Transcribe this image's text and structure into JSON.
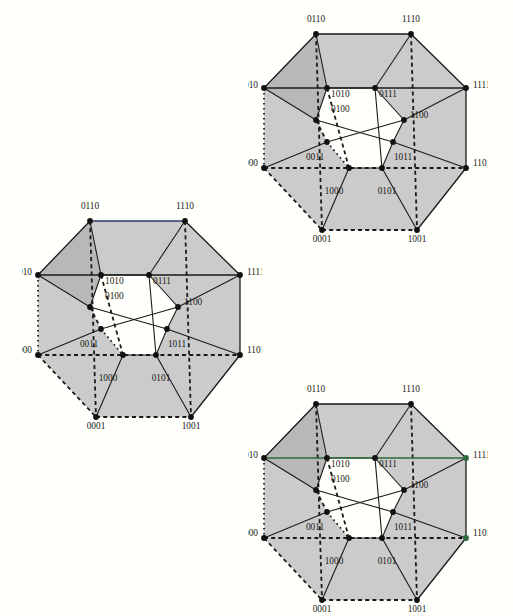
{
  "document": {
    "title": "Four-dimensional hypercube (tesseract) vertex-labelled diagrams",
    "figure_count": 3,
    "background_color": "#fffffb",
    "face_shade_color": "#c8c8c8",
    "face_shade_dark_color": "#b4b4b4",
    "edge_color": "#1a1a1a",
    "accent_green": "#2f6b3a",
    "accent_navy": "#2b3a6b",
    "vertex_color": "#111111"
  },
  "vertex_labels": {
    "v0000": "0000",
    "v0001": "0001",
    "v0010": "0010",
    "v0011": "0011",
    "v0100": "0100",
    "v0101": "0101",
    "v0110": "0110",
    "v0111": "0111",
    "v1000": "1000",
    "v1001": "1001",
    "v1010": "1010",
    "v1011": "1011",
    "v1100": "1100",
    "v1101": "1101",
    "v1110": "1110",
    "v1111": "1111"
  },
  "figures": [
    {
      "id": "figure-top-right",
      "name": "tesseract-top-right",
      "position": {
        "left": 248,
        "top": 8
      },
      "highlight_edges": [],
      "labels": [
        {
          "key": "v0110",
          "text": "0110",
          "x": 68,
          "y": 14,
          "anchor": "middle"
        },
        {
          "key": "v1110",
          "text": "1110",
          "x": 163,
          "y": 14,
          "anchor": "middle"
        },
        {
          "key": "v0010",
          "text": "0010",
          "x": 10,
          "y": 80,
          "anchor": "end"
        },
        {
          "key": "v1111",
          "text": "1111",
          "x": 225,
          "y": 80,
          "anchor": "start"
        },
        {
          "key": "v1010",
          "text": "1010",
          "x": 83,
          "y": 89,
          "anchor": "start"
        },
        {
          "key": "v0111",
          "text": "0111",
          "x": 131,
          "y": 89,
          "anchor": "start"
        },
        {
          "key": "v0100",
          "text": "0100",
          "x": 83,
          "y": 104,
          "anchor": "start"
        },
        {
          "key": "v1100",
          "text": "1100",
          "x": 162,
          "y": 110,
          "anchor": "start"
        },
        {
          "key": "v0011",
          "text": "0011",
          "x": 67,
          "y": 152,
          "anchor": "middle"
        },
        {
          "key": "v1011",
          "text": "1011",
          "x": 155,
          "y": 152,
          "anchor": "middle"
        },
        {
          "key": "v0000",
          "text": "0000",
          "x": 10,
          "y": 158,
          "anchor": "end"
        },
        {
          "key": "v1101",
          "text": "1101",
          "x": 225,
          "y": 158,
          "anchor": "start"
        },
        {
          "key": "v1000",
          "text": "1000",
          "x": 86,
          "y": 186,
          "anchor": "middle"
        },
        {
          "key": "v0101",
          "text": "0101",
          "x": 139,
          "y": 186,
          "anchor": "middle"
        },
        {
          "key": "v0001",
          "text": "0001",
          "x": 74,
          "y": 234,
          "anchor": "middle"
        },
        {
          "key": "v1001",
          "text": "1001",
          "x": 169,
          "y": 234,
          "anchor": "middle"
        }
      ]
    },
    {
      "id": "figure-middle-left",
      "name": "tesseract-middle-left",
      "position": {
        "left": 22,
        "top": 195
      },
      "highlight_edges": [
        "0110-1110",
        "0001-1001",
        "0100-1100",
        "0011-1011",
        "0010-0000"
      ],
      "labels": [
        {
          "key": "v0110",
          "text": "0110",
          "x": 68,
          "y": 14,
          "anchor": "middle"
        },
        {
          "key": "v1110",
          "text": "1110",
          "x": 163,
          "y": 14,
          "anchor": "middle"
        },
        {
          "key": "v0010",
          "text": "0010",
          "x": 10,
          "y": 80,
          "anchor": "end"
        },
        {
          "key": "v1111",
          "text": "1111",
          "x": 225,
          "y": 80,
          "anchor": "start"
        },
        {
          "key": "v1010",
          "text": "1010",
          "x": 83,
          "y": 89,
          "anchor": "start"
        },
        {
          "key": "v0111",
          "text": "0111",
          "x": 131,
          "y": 89,
          "anchor": "start"
        },
        {
          "key": "v0100",
          "text": "0100",
          "x": 83,
          "y": 104,
          "anchor": "start"
        },
        {
          "key": "v1100",
          "text": "1100",
          "x": 162,
          "y": 110,
          "anchor": "start"
        },
        {
          "key": "v0011",
          "text": "0011",
          "x": 67,
          "y": 152,
          "anchor": "middle"
        },
        {
          "key": "v1011",
          "text": "1011",
          "x": 155,
          "y": 152,
          "anchor": "middle"
        },
        {
          "key": "v0000",
          "text": "0000",
          "x": 10,
          "y": 158,
          "anchor": "end"
        },
        {
          "key": "v1101",
          "text": "1101",
          "x": 225,
          "y": 158,
          "anchor": "start"
        },
        {
          "key": "v1000",
          "text": "1000",
          "x": 86,
          "y": 186,
          "anchor": "middle"
        },
        {
          "key": "v0101",
          "text": "0101",
          "x": 139,
          "y": 186,
          "anchor": "middle"
        },
        {
          "key": "v0001",
          "text": "0001",
          "x": 74,
          "y": 234,
          "anchor": "middle"
        },
        {
          "key": "v1001",
          "text": "1001",
          "x": 169,
          "y": 234,
          "anchor": "middle"
        }
      ]
    },
    {
      "id": "figure-bottom-right",
      "name": "tesseract-bottom-right",
      "position": {
        "left": 248,
        "top": 378
      },
      "highlight_edges": [
        "0010-1111",
        "0000-1101"
      ],
      "labels": [
        {
          "key": "v0110",
          "text": "0110",
          "x": 68,
          "y": 14,
          "anchor": "middle"
        },
        {
          "key": "v1110",
          "text": "1110",
          "x": 163,
          "y": 14,
          "anchor": "middle"
        },
        {
          "key": "v0010",
          "text": "0010",
          "x": 10,
          "y": 80,
          "anchor": "end"
        },
        {
          "key": "v1111",
          "text": "1111",
          "x": 225,
          "y": 80,
          "anchor": "start"
        },
        {
          "key": "v1010",
          "text": "1010",
          "x": 83,
          "y": 89,
          "anchor": "start"
        },
        {
          "key": "v0111",
          "text": "0111",
          "x": 131,
          "y": 89,
          "anchor": "start"
        },
        {
          "key": "v0100",
          "text": "0100",
          "x": 83,
          "y": 104,
          "anchor": "start"
        },
        {
          "key": "v1100",
          "text": "1100",
          "x": 162,
          "y": 110,
          "anchor": "start"
        },
        {
          "key": "v0011",
          "text": "0011",
          "x": 67,
          "y": 152,
          "anchor": "middle"
        },
        {
          "key": "v1011",
          "text": "1011",
          "x": 155,
          "y": 152,
          "anchor": "middle"
        },
        {
          "key": "v0000",
          "text": "0000",
          "x": 10,
          "y": 158,
          "anchor": "end"
        },
        {
          "key": "v1101",
          "text": "1101",
          "x": 225,
          "y": 158,
          "anchor": "start"
        },
        {
          "key": "v1000",
          "text": "1000",
          "x": 86,
          "y": 186,
          "anchor": "middle"
        },
        {
          "key": "v0101",
          "text": "0101",
          "x": 139,
          "y": 186,
          "anchor": "middle"
        },
        {
          "key": "v0001",
          "text": "0001",
          "x": 74,
          "y": 234,
          "anchor": "middle"
        },
        {
          "key": "v1001",
          "text": "1001",
          "x": 169,
          "y": 234,
          "anchor": "middle"
        }
      ]
    }
  ],
  "geometry": {
    "note": "Vertex pixel coordinates inside each figure's local SVG viewport (240x245).",
    "vertices": {
      "0110": [
        68,
        26
      ],
      "1110": [
        163,
        26
      ],
      "0010": [
        16,
        80
      ],
      "1111": [
        218,
        80
      ],
      "1010": [
        79,
        80
      ],
      "0111": [
        127,
        80
      ],
      "0100": [
        68,
        112
      ],
      "1100": [
        156,
        112
      ],
      "0011": [
        79,
        134
      ],
      "1011": [
        145,
        134
      ],
      "0000": [
        16,
        160
      ],
      "1101": [
        218,
        160
      ],
      "1000": [
        101,
        160
      ],
      "0101": [
        134,
        160
      ],
      "0001": [
        74,
        222
      ],
      "1001": [
        169,
        222
      ]
    }
  }
}
